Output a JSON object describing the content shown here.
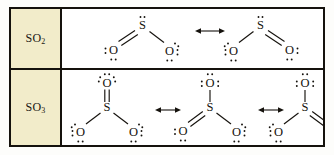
{
  "figure": {
    "background_color": "#ffffff",
    "border_color": "#15120d",
    "label_cell_color": "#f2ecca",
    "ink_color": "#15120d"
  },
  "rows": [
    {
      "id": "so2",
      "label": "SO",
      "label_sub": "2",
      "label_full": "SO2",
      "structure_count": 2,
      "arrow_count": 1,
      "arrow_symbol": "↔",
      "structures": [
        {
          "name": "so2-resonance-1",
          "central_atom": "S",
          "central_lone_pairs": 1,
          "atoms": [
            {
              "symbol": "S",
              "position": "top-center",
              "lone_pairs": 1,
              "lone_pair_sides": [
                "top"
              ]
            },
            {
              "symbol": "O",
              "position": "bottom-left",
              "bond": "double",
              "lone_pairs": 2,
              "lone_pair_sides": [
                "left",
                "bottom"
              ]
            },
            {
              "symbol": "O",
              "position": "bottom-right",
              "bond": "single",
              "lone_pairs": 3,
              "lone_pair_sides": [
                "top-right",
                "right",
                "bottom"
              ]
            }
          ],
          "bonds": [
            {
              "from": "S",
              "to": "O-left",
              "order": 2
            },
            {
              "from": "S",
              "to": "O-right",
              "order": 1
            }
          ]
        },
        {
          "name": "so2-resonance-2",
          "central_atom": "S",
          "central_lone_pairs": 1,
          "atoms": [
            {
              "symbol": "S",
              "position": "top-center",
              "lone_pairs": 1,
              "lone_pair_sides": [
                "top"
              ]
            },
            {
              "symbol": "O",
              "position": "bottom-left",
              "bond": "single",
              "lone_pairs": 3,
              "lone_pair_sides": [
                "top-left",
                "left",
                "bottom"
              ]
            },
            {
              "symbol": "O",
              "position": "bottom-right",
              "bond": "double",
              "lone_pairs": 2,
              "lone_pair_sides": [
                "right",
                "bottom"
              ]
            }
          ],
          "bonds": [
            {
              "from": "S",
              "to": "O-left",
              "order": 1
            },
            {
              "from": "S",
              "to": "O-right",
              "order": 2
            }
          ]
        }
      ]
    },
    {
      "id": "so3",
      "label": "SO",
      "label_sub": "3",
      "label_full": "SO3",
      "structure_count": 3,
      "arrow_count": 2,
      "arrow_symbol": "↔",
      "structures": [
        {
          "name": "so3-resonance-1",
          "central_atom": "S",
          "central_lone_pairs": 0,
          "atoms": [
            {
              "symbol": "S",
              "position": "center",
              "lone_pairs": 0,
              "lone_pair_sides": []
            },
            {
              "symbol": "O",
              "position": "top",
              "bond": "double",
              "lone_pairs": 3,
              "lone_pair_sides": [
                "left",
                "top",
                "right"
              ]
            },
            {
              "symbol": "O",
              "position": "bottom-left",
              "bond": "single",
              "lone_pairs": 3,
              "lone_pair_sides": [
                "top-left",
                "left",
                "bottom"
              ]
            },
            {
              "symbol": "O",
              "position": "bottom-right",
              "bond": "single",
              "lone_pairs": 3,
              "lone_pair_sides": [
                "top-right",
                "right",
                "bottom"
              ]
            }
          ],
          "bonds": [
            {
              "from": "S",
              "to": "O-top",
              "order": 2
            },
            {
              "from": "S",
              "to": "O-bottom-left",
              "order": 1
            },
            {
              "from": "S",
              "to": "O-bottom-right",
              "order": 1
            }
          ]
        },
        {
          "name": "so3-resonance-2",
          "central_atom": "S",
          "central_lone_pairs": 0,
          "atoms": [
            {
              "symbol": "S",
              "position": "center",
              "lone_pairs": 0,
              "lone_pair_sides": []
            },
            {
              "symbol": "O",
              "position": "top",
              "bond": "single",
              "lone_pairs": 3,
              "lone_pair_sides": [
                "left",
                "top",
                "right"
              ]
            },
            {
              "symbol": "O",
              "position": "bottom-left",
              "bond": "double",
              "lone_pairs": 2,
              "lone_pair_sides": [
                "left",
                "bottom"
              ]
            },
            {
              "symbol": "O",
              "position": "bottom-right",
              "bond": "single",
              "lone_pairs": 3,
              "lone_pair_sides": [
                "top-right",
                "right",
                "bottom"
              ]
            }
          ],
          "bonds": [
            {
              "from": "S",
              "to": "O-top",
              "order": 1
            },
            {
              "from": "S",
              "to": "O-bottom-left",
              "order": 2
            },
            {
              "from": "S",
              "to": "O-bottom-right",
              "order": 1
            }
          ]
        },
        {
          "name": "so3-resonance-3",
          "central_atom": "S",
          "central_lone_pairs": 0,
          "atoms": [
            {
              "symbol": "S",
              "position": "center",
              "lone_pairs": 0,
              "lone_pair_sides": []
            },
            {
              "symbol": "O",
              "position": "top",
              "bond": "single",
              "lone_pairs": 3,
              "lone_pair_sides": [
                "left",
                "top",
                "right"
              ]
            },
            {
              "symbol": "O",
              "position": "bottom-left",
              "bond": "single",
              "lone_pairs": 3,
              "lone_pair_sides": [
                "top-left",
                "left",
                "bottom"
              ]
            },
            {
              "symbol": "O",
              "position": "bottom-right",
              "bond": "double",
              "lone_pairs": 2,
              "lone_pair_sides": [
                "right",
                "bottom"
              ]
            }
          ],
          "bonds": [
            {
              "from": "S",
              "to": "O-top",
              "order": 1
            },
            {
              "from": "S",
              "to": "O-bottom-left",
              "order": 1
            },
            {
              "from": "S",
              "to": "O-bottom-right",
              "order": 2
            }
          ]
        }
      ]
    }
  ],
  "atom_symbols": {
    "sulfur": "S",
    "oxygen": "O"
  }
}
